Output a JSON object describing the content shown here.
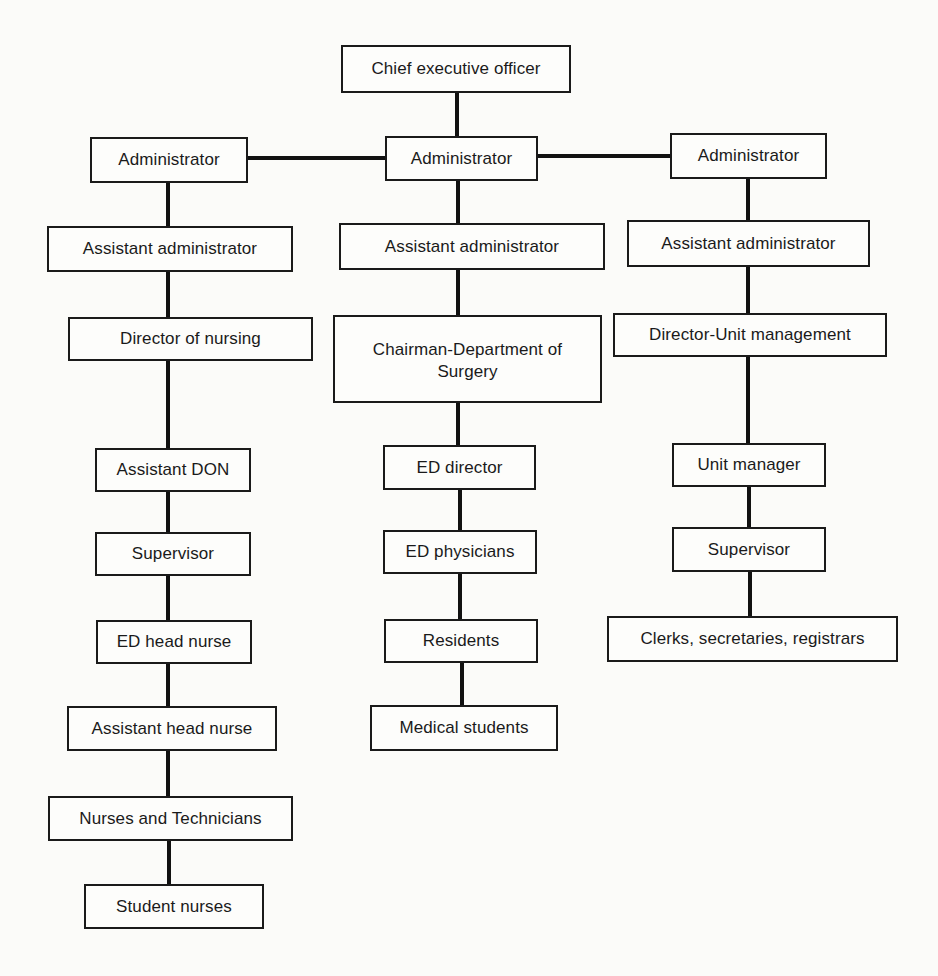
{
  "chart": {
    "top": {
      "label": "Chief executive officer"
    },
    "columns": [
      {
        "name": "nursing",
        "nodes": [
          {
            "label": "Administrator"
          },
          {
            "label": "Assistant administrator"
          },
          {
            "label": "Director of nursing"
          },
          {
            "label": "Assistant DON"
          },
          {
            "label": "Supervisor"
          },
          {
            "label": "ED head nurse"
          },
          {
            "label": "Assistant head nurse"
          },
          {
            "label": "Nurses and Technicians"
          },
          {
            "label": "Student nurses"
          }
        ]
      },
      {
        "name": "medical",
        "nodes": [
          {
            "label": "Administrator"
          },
          {
            "label": "Assistant administrator"
          },
          {
            "label": "Chairman-Department of Surgery"
          },
          {
            "label": "ED director"
          },
          {
            "label": "ED physicians"
          },
          {
            "label": "Residents"
          },
          {
            "label": "Medical students"
          }
        ]
      },
      {
        "name": "unit-management",
        "nodes": [
          {
            "label": "Administrator"
          },
          {
            "label": "Assistant administrator"
          },
          {
            "label": "Director-Unit management"
          },
          {
            "label": "Unit manager"
          },
          {
            "label": "Supervisor"
          },
          {
            "label": "Clerks, secretaries, registrars"
          }
        ]
      }
    ]
  }
}
